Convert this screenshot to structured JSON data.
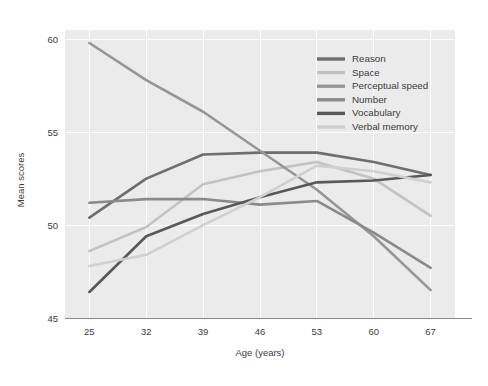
{
  "chart_data": {
    "type": "line",
    "title": "",
    "xlabel": "Age (years)",
    "ylabel": "Mean scores",
    "categories": [
      25,
      32,
      39,
      46,
      53,
      60,
      67
    ],
    "x": [
      25,
      32,
      39,
      46,
      53,
      60,
      67
    ],
    "xlim": [
      22,
      70
    ],
    "ylim": [
      45,
      60.5
    ],
    "xticks": [
      "25",
      "32",
      "39",
      "46",
      "53",
      "60",
      "67"
    ],
    "yticks": [
      "45",
      "50",
      "55",
      "60"
    ],
    "grid": true,
    "legend_position": "top-right",
    "series": [
      {
        "name": "Reason",
        "color": "#6e6e6e",
        "values": [
          50.4,
          52.5,
          53.8,
          53.9,
          53.9,
          53.4,
          52.7
        ]
      },
      {
        "name": "Space",
        "color": "#c2c2c2",
        "values": [
          48.6,
          49.9,
          52.2,
          52.9,
          53.4,
          52.5,
          50.5
        ]
      },
      {
        "name": "Perceptual speed",
        "color": "#969696",
        "values": [
          59.8,
          57.8,
          56.1,
          54.0,
          51.9,
          49.4,
          46.5
        ]
      },
      {
        "name": "Number",
        "color": "#8a8a8a",
        "values": [
          51.2,
          51.4,
          51.4,
          51.1,
          51.3,
          49.6,
          47.7
        ]
      },
      {
        "name": "Vocabulary",
        "color": "#585858",
        "values": [
          46.4,
          49.4,
          50.6,
          51.5,
          52.3,
          52.4,
          52.7
        ]
      },
      {
        "name": "Verbal memory",
        "color": "#cfcfcf",
        "values": [
          47.8,
          48.4,
          50.0,
          51.5,
          53.2,
          52.9,
          52.3
        ]
      }
    ]
  },
  "legend": {
    "items": [
      {
        "label": "Reason"
      },
      {
        "label": "Space"
      },
      {
        "label": "Perceptual speed"
      },
      {
        "label": "Number"
      },
      {
        "label": "Vocabulary"
      },
      {
        "label": "Verbal memory"
      }
    ]
  },
  "axes": {
    "x_title": "Age (years)",
    "y_title": "Mean scores"
  }
}
